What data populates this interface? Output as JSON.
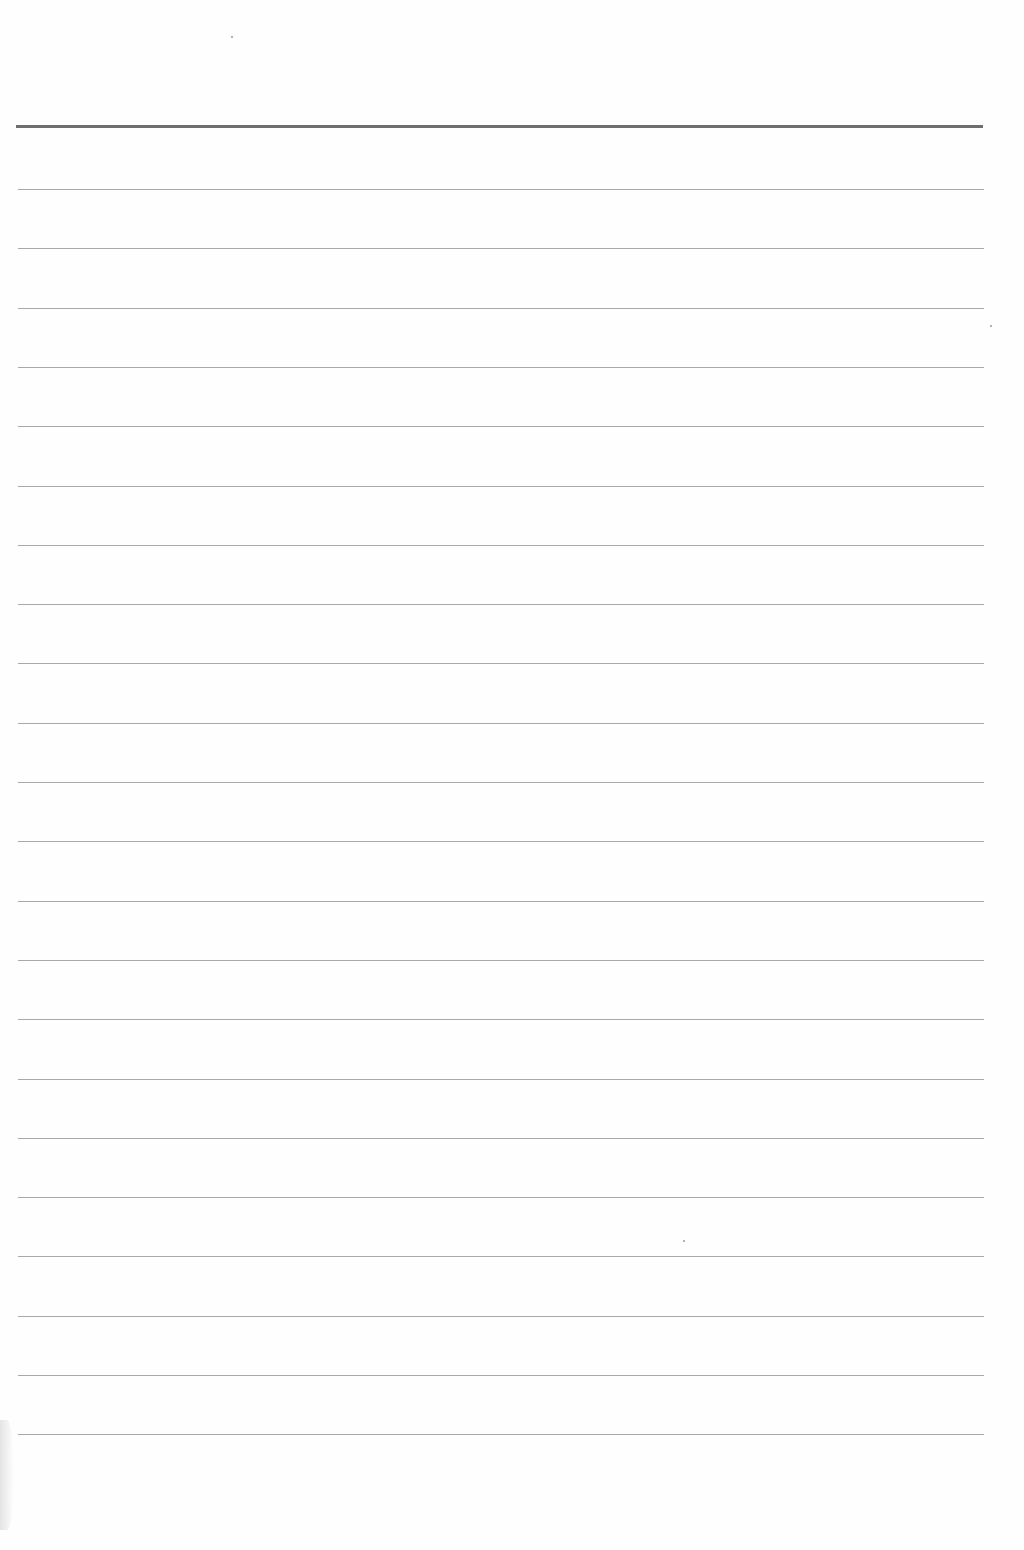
{
  "page": {
    "type": "ruled-paper",
    "background_color": "#fefefe",
    "text_content": []
  },
  "ruling": {
    "header_line": {
      "y": 125,
      "x_start": 16,
      "x_end": 983,
      "thickness": 3,
      "color": "#6e6e6e"
    },
    "lines": {
      "first_y": 189,
      "spacing": 59.3,
      "count": 22,
      "x_start": 18,
      "x_end": 984,
      "thickness": 1,
      "color": "#a8a8a8"
    }
  },
  "specks": [
    {
      "x": 231,
      "y": 36
    },
    {
      "x": 990,
      "y": 325
    },
    {
      "x": 683,
      "y": 1240
    }
  ]
}
